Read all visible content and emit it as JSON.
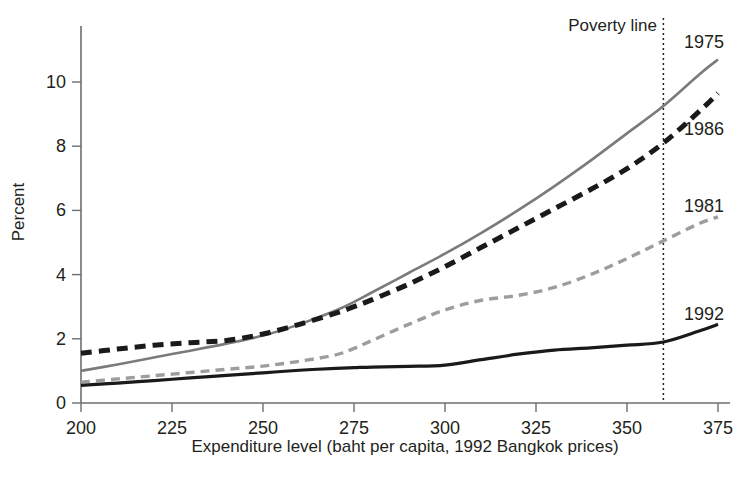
{
  "chart_data": {
    "type": "line",
    "title": "",
    "xlabel": "Expenditure level (baht per capita, 1992 Bangkok prices)",
    "ylabel": "Percent",
    "xlim": [
      200,
      375
    ],
    "ylim": [
      0,
      11.6
    ],
    "xticks": [
      200,
      225,
      250,
      275,
      300,
      325,
      350,
      375
    ],
    "yticks": [
      0,
      2,
      4,
      6,
      8,
      10
    ],
    "xtick_labels": [
      "200",
      "225",
      "250",
      "275",
      "300",
      "325",
      "350",
      "375"
    ],
    "ytick_labels": [
      "0",
      "2",
      "4",
      "6",
      "8",
      "10"
    ],
    "grid": false,
    "legend_position": "right-inline-labels",
    "x": [
      200,
      210,
      220,
      230,
      240,
      250,
      260,
      270,
      275,
      280,
      290,
      300,
      310,
      320,
      330,
      340,
      350,
      360,
      370,
      375
    ],
    "series": [
      {
        "name": "1975",
        "label": "1975",
        "color": "#7b7b7b",
        "style": "solid",
        "width": 2.6,
        "values": [
          1.0,
          1.2,
          1.42,
          1.63,
          1.85,
          2.1,
          2.45,
          2.88,
          3.15,
          3.45,
          4.05,
          4.65,
          5.3,
          6.0,
          6.75,
          7.55,
          8.4,
          9.25,
          10.25,
          10.7
        ],
        "label_value": 10.7
      },
      {
        "name": "1986",
        "label": "1986",
        "color": "#1a1a1a",
        "style": "dashed",
        "width": 5.0,
        "dash": "11 7",
        "values": [
          1.55,
          1.68,
          1.8,
          1.88,
          1.95,
          2.15,
          2.45,
          2.8,
          3.0,
          3.22,
          3.7,
          4.25,
          4.85,
          5.45,
          6.05,
          6.65,
          7.3,
          8.1,
          9.1,
          9.65
        ],
        "label_value": 8.7
      },
      {
        "name": "1981",
        "label": "1981",
        "color": "#9d9d9d",
        "style": "dashed",
        "width": 3.4,
        "dash": "9 6",
        "values": [
          0.65,
          0.75,
          0.85,
          0.95,
          1.05,
          1.15,
          1.3,
          1.5,
          1.7,
          1.95,
          2.45,
          2.9,
          3.2,
          3.35,
          3.6,
          4.0,
          4.5,
          5.05,
          5.6,
          5.8
        ],
        "label_value": 6.3
      },
      {
        "name": "1992",
        "label": "1992",
        "color": "#1a1a1a",
        "style": "solid",
        "width": 3.2,
        "values": [
          0.55,
          0.62,
          0.7,
          0.78,
          0.86,
          0.94,
          1.02,
          1.08,
          1.1,
          1.12,
          1.14,
          1.18,
          1.35,
          1.52,
          1.65,
          1.72,
          1.8,
          1.9,
          2.25,
          2.45
        ],
        "label_value": 3.0
      }
    ],
    "annotations": [
      {
        "name": "poverty-line",
        "label": "Poverty line",
        "type": "vline",
        "x": 360,
        "style": "dotted"
      }
    ]
  },
  "labels": {
    "percent_axis": "Percent",
    "expenditure_axis": "Expenditure level (baht per capita, 1992 Bangkok prices)",
    "poverty_line": "Poverty line",
    "s1975": "1975",
    "s1986": "1986",
    "s1981": "1981",
    "s1992": "1992"
  }
}
